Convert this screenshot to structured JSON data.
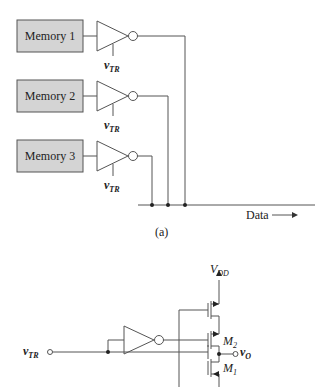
{
  "figure_a": {
    "memories": [
      {
        "label": "Memory 1",
        "control": "v",
        "control_sub": "TR"
      },
      {
        "label": "Memory 2",
        "control": "v",
        "control_sub": "TR"
      },
      {
        "label": "Memory 3",
        "control": "v",
        "control_sub": "TR"
      }
    ],
    "bus_label": "Data",
    "caption": "(a)"
  },
  "figure_b": {
    "supply": "V",
    "supply_sub": "DD",
    "input": "v",
    "input_sub": "TR",
    "output": "v",
    "output_sub": "O",
    "m2": "M",
    "m2_sub": "2",
    "m1": "M",
    "m1_sub": "1"
  },
  "colors": {
    "box_fill": "#d4d4d4",
    "line": "#555555"
  }
}
